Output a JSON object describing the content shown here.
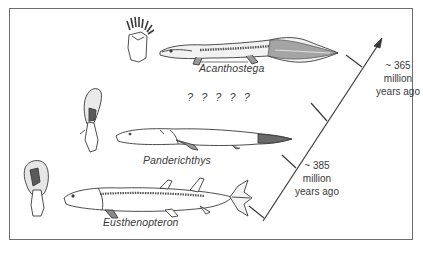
{
  "figure": {
    "border_color": "#6e6e6e",
    "line_color": "#3a3a3a",
    "fill_dark": "#5a5a5a",
    "fill_light": "#bdbdbd"
  },
  "species": [
    {
      "name": "Acanthostega",
      "limb": "forelimb-with-digits"
    },
    {
      "name": "Panderichthys",
      "limb": "pectoral-fin"
    },
    {
      "name": "Eusthenopteron",
      "limb": "pectoral-fin"
    }
  ],
  "unknown_forms": "? ? ? ? ?",
  "timeline": {
    "direction": "arrow-up-right",
    "tick_count": 4,
    "labels": [
      {
        "approx": "~ 365",
        "unit": "million",
        "suffix": "years ago"
      },
      {
        "approx": "~ 385",
        "unit": "million",
        "suffix": "years ago"
      }
    ]
  }
}
